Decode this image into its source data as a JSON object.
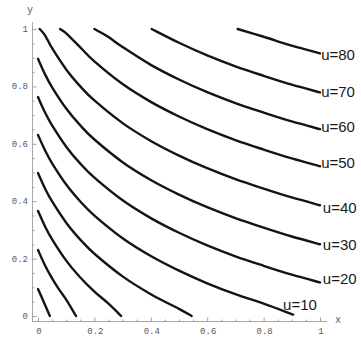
{
  "chart_data": {
    "type": "line",
    "title": "",
    "xlabel": "x",
    "ylabel": "y",
    "xlim": [
      0,
      1
    ],
    "ylim": [
      0,
      1
    ],
    "grid": false,
    "legend": null,
    "xticks": [
      0,
      0.2,
      0.4,
      0.6,
      0.8,
      1
    ],
    "xtick_labels": [
      "0",
      "0.2",
      "0.4",
      "0.6",
      "0.8",
      "1"
    ],
    "yticks": [
      0,
      0.2,
      0.4,
      0.6,
      0.8,
      1
    ],
    "ytick_labels": [
      "0",
      "0.2",
      "0.4",
      "0.6",
      "0.8",
      "1"
    ],
    "line_color": "#141414",
    "series": [
      {
        "name": "curve-1",
        "label": "",
        "points": [
          [
            0,
            0.094
          ],
          [
            0.02,
            0.05
          ],
          [
            0.042,
            0
          ]
        ]
      },
      {
        "name": "curve-2",
        "label": "",
        "points": [
          [
            0,
            0.23
          ],
          [
            0.025,
            0.176
          ],
          [
            0.05,
            0.131
          ],
          [
            0.075,
            0.092
          ],
          [
            0.1,
            0.057
          ],
          [
            0.135,
            0
          ]
        ]
      },
      {
        "name": "curve-3",
        "label": "",
        "points": [
          [
            0,
            0.366
          ],
          [
            0.025,
            0.312
          ],
          [
            0.05,
            0.267
          ],
          [
            0.1,
            0.193
          ],
          [
            0.15,
            0.134
          ],
          [
            0.2,
            0.085
          ],
          [
            0.25,
            0.043
          ],
          [
            0.295,
            0
          ]
        ]
      },
      {
        "name": "curve-4",
        "label": "",
        "points": [
          [
            0,
            0.498
          ],
          [
            0.025,
            0.444
          ],
          [
            0.05,
            0.399
          ],
          [
            0.1,
            0.325
          ],
          [
            0.15,
            0.266
          ],
          [
            0.2,
            0.217
          ],
          [
            0.3,
            0.138
          ],
          [
            0.4,
            0.076
          ],
          [
            0.5,
            0.025
          ],
          [
            0.545,
            0
          ]
        ]
      },
      {
        "name": "u=10",
        "label": "u=10",
        "points": [
          [
            0,
            0.631
          ],
          [
            0.025,
            0.577
          ],
          [
            0.05,
            0.532
          ],
          [
            0.1,
            0.458
          ],
          [
            0.15,
            0.399
          ],
          [
            0.2,
            0.35
          ],
          [
            0.3,
            0.271
          ],
          [
            0.4,
            0.209
          ],
          [
            0.5,
            0.158
          ],
          [
            0.6,
            0.114
          ],
          [
            0.7,
            0.076
          ],
          [
            0.8,
            0.043
          ],
          [
            0.905,
            0.005
          ]
        ]
      },
      {
        "name": "u=20",
        "label": "u=20",
        "points": [
          [
            0,
            0.763
          ],
          [
            0.025,
            0.709
          ],
          [
            0.05,
            0.664
          ],
          [
            0.1,
            0.59
          ],
          [
            0.15,
            0.531
          ],
          [
            0.2,
            0.482
          ],
          [
            0.3,
            0.403
          ],
          [
            0.4,
            0.341
          ],
          [
            0.5,
            0.29
          ],
          [
            0.6,
            0.246
          ],
          [
            0.7,
            0.208
          ],
          [
            0.8,
            0.175
          ],
          [
            0.9,
            0.144
          ],
          [
            1,
            0.117
          ]
        ]
      },
      {
        "name": "u=30",
        "label": "u=30",
        "points": [
          [
            0,
            0.896
          ],
          [
            0.025,
            0.842
          ],
          [
            0.05,
            0.797
          ],
          [
            0.1,
            0.723
          ],
          [
            0.15,
            0.664
          ],
          [
            0.2,
            0.615
          ],
          [
            0.3,
            0.536
          ],
          [
            0.4,
            0.474
          ],
          [
            0.5,
            0.423
          ],
          [
            0.6,
            0.379
          ],
          [
            0.7,
            0.341
          ],
          [
            0.8,
            0.308
          ],
          [
            0.9,
            0.277
          ],
          [
            1,
            0.25
          ]
        ]
      },
      {
        "name": "u=40",
        "label": "u=40",
        "points": [
          [
            0.006,
            1.0
          ],
          [
            0.025,
            0.978
          ],
          [
            0.05,
            0.933
          ],
          [
            0.1,
            0.859
          ],
          [
            0.15,
            0.8
          ],
          [
            0.2,
            0.751
          ],
          [
            0.3,
            0.672
          ],
          [
            0.4,
            0.61
          ],
          [
            0.5,
            0.559
          ],
          [
            0.6,
            0.515
          ],
          [
            0.7,
            0.477
          ],
          [
            0.8,
            0.444
          ],
          [
            0.9,
            0.413
          ],
          [
            1,
            0.386
          ]
        ]
      },
      {
        "name": "u=50",
        "label": "u=50",
        "points": [
          [
            0.078,
            1.0
          ],
          [
            0.1,
            0.985
          ],
          [
            0.15,
            0.936
          ],
          [
            0.2,
            0.887
          ],
          [
            0.3,
            0.808
          ],
          [
            0.4,
            0.746
          ],
          [
            0.5,
            0.695
          ],
          [
            0.6,
            0.651
          ],
          [
            0.7,
            0.613
          ],
          [
            0.8,
            0.58
          ],
          [
            0.9,
            0.549
          ],
          [
            1,
            0.522
          ]
        ]
      },
      {
        "name": "u=60",
        "label": "u=60",
        "points": [
          [
            0.2,
            1.0
          ],
          [
            0.25,
            0.972
          ],
          [
            0.3,
            0.937
          ],
          [
            0.4,
            0.875
          ],
          [
            0.5,
            0.824
          ],
          [
            0.6,
            0.78
          ],
          [
            0.7,
            0.742
          ],
          [
            0.8,
            0.709
          ],
          [
            0.9,
            0.678
          ],
          [
            1,
            0.651
          ]
        ]
      },
      {
        "name": "u=70",
        "label": "u=70",
        "points": [
          [
            0.403,
            1.0
          ],
          [
            0.5,
            0.952
          ],
          [
            0.6,
            0.908
          ],
          [
            0.7,
            0.87
          ],
          [
            0.8,
            0.837
          ],
          [
            0.9,
            0.806
          ],
          [
            1,
            0.779
          ]
        ]
      },
      {
        "name": "u=80",
        "label": "u=80",
        "points": [
          [
            0.708,
            1.0
          ],
          [
            0.8,
            0.973
          ],
          [
            0.9,
            0.942
          ],
          [
            1,
            0.915
          ]
        ]
      }
    ],
    "annotations": [
      {
        "text": "u=80",
        "at": [
          1.004,
          0.892
        ]
      },
      {
        "text": "u=70",
        "at": [
          1.004,
          0.763
        ]
      },
      {
        "text": "u=60",
        "at": [
          1.004,
          0.641
        ]
      },
      {
        "text": "u=50",
        "at": [
          1.004,
          0.516
        ]
      },
      {
        "text": "u=40",
        "at": [
          1.01,
          0.359
        ]
      },
      {
        "text": "u=30",
        "at": [
          1.01,
          0.23
        ]
      },
      {
        "text": "u=20",
        "at": [
          1.01,
          0.111
        ]
      },
      {
        "text": "u=10",
        "at": [
          0.869,
          0.021
        ]
      }
    ]
  }
}
